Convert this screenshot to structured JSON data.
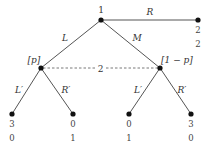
{
  "diagram": {
    "type": "extensive-form game tree",
    "root": {
      "player_label": "1",
      "actions": {
        "left": "L",
        "middle": "M",
        "right": "R"
      }
    },
    "terminal_R": {
      "payoff_p1": "2",
      "payoff_p2": "2"
    },
    "information_set": {
      "player_label": "2",
      "left_belief": "[p]",
      "right_belief": "[1 − p]"
    },
    "left_node": {
      "actions": {
        "left": "L′",
        "right": "R′"
      }
    },
    "right_node": {
      "actions": {
        "left": "L′",
        "right": "R′"
      }
    },
    "leaves": [
      {
        "path": "L, L′",
        "payoff_p1": "3",
        "payoff_p2": "0"
      },
      {
        "path": "L, R′",
        "payoff_p1": "0",
        "payoff_p2": "1"
      },
      {
        "path": "M, L′",
        "payoff_p1": "0",
        "payoff_p2": "1"
      },
      {
        "path": "M, R′",
        "payoff_p1": "3",
        "payoff_p2": "0"
      }
    ]
  }
}
